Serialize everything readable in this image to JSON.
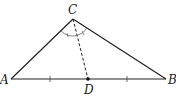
{
  "diagram": {
    "type": "triangle-angle-bisector",
    "points": {
      "A": {
        "label": "A",
        "x": 11,
        "y": 79
      },
      "B": {
        "label": "B",
        "x": 166,
        "y": 79
      },
      "C": {
        "label": "C",
        "x": 73,
        "y": 19
      },
      "D": {
        "label": "D",
        "x": 88,
        "y": 79
      }
    },
    "segments": [
      {
        "from": "A",
        "to": "C",
        "style": "solid"
      },
      {
        "from": "C",
        "to": "B",
        "style": "solid"
      },
      {
        "from": "A",
        "to": "B",
        "style": "solid"
      },
      {
        "from": "C",
        "to": "D",
        "style": "dashed"
      }
    ],
    "tick_marks_on_AB": [
      50,
      127
    ],
    "angle_marks_at_C": "equal angles ACD and DCB",
    "colors": {
      "stroke": "#222222",
      "arc": "#666666"
    }
  }
}
